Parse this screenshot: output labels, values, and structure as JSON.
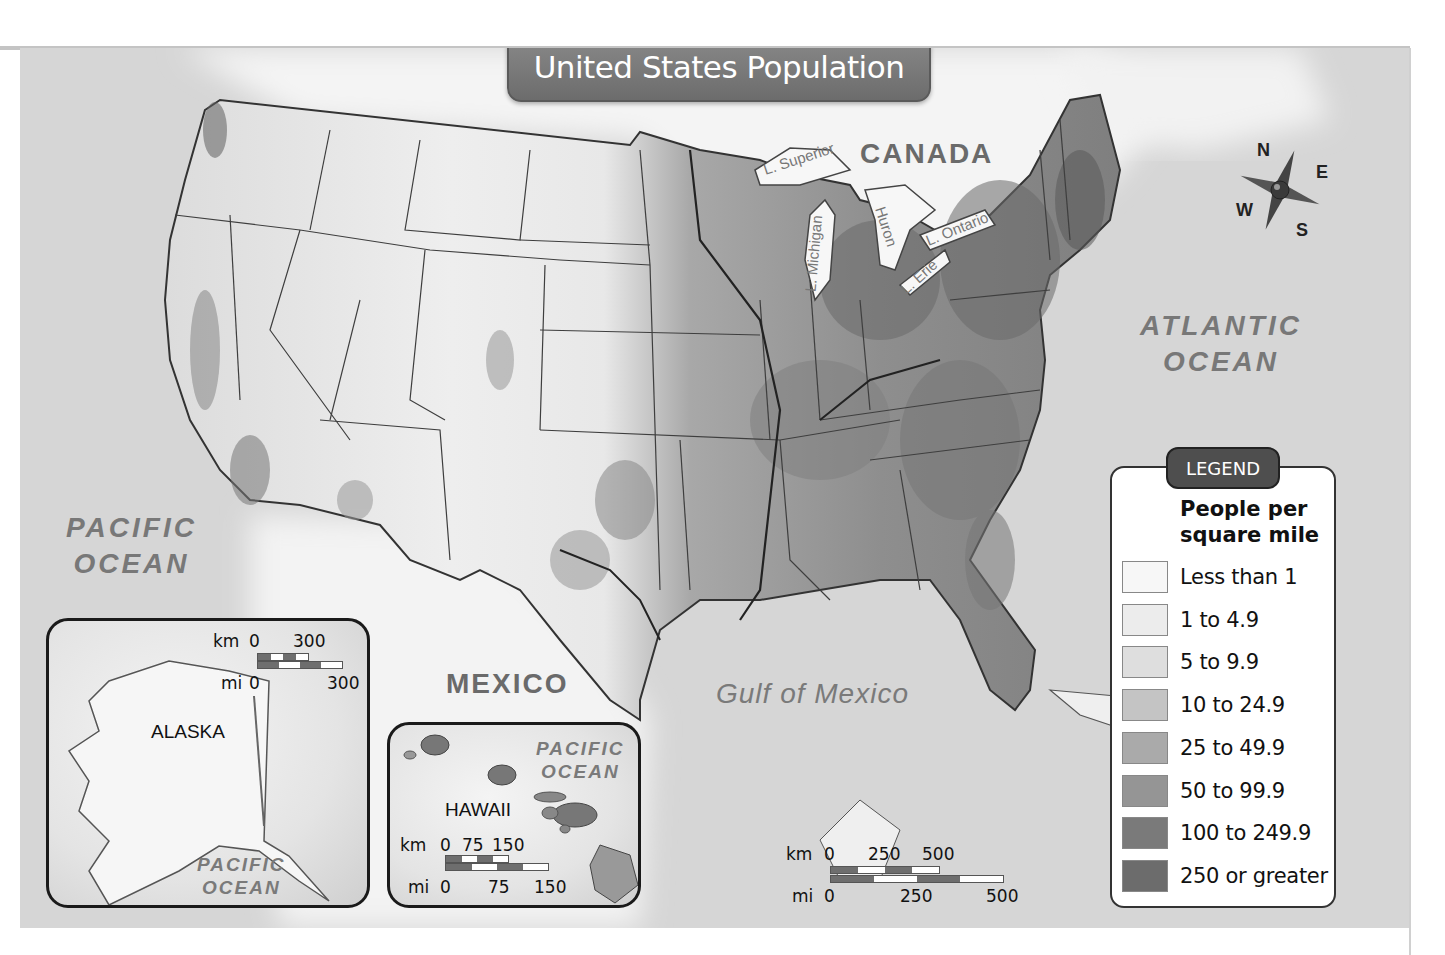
{
  "title": "United States Population",
  "labels": {
    "canada": "CANADA",
    "mexico": "MEXICO",
    "gulf": "Gulf of Mexico",
    "atlantic_line1": "ATLANTIC",
    "atlantic_line2": "OCEAN",
    "pacific_line1": "PACIFIC",
    "pacific_line2": "OCEAN"
  },
  "lakes": {
    "superior": "L. Superior",
    "michigan": "L. Michigan",
    "huron": "Huron",
    "ontario": "L. Ontario",
    "erie": "L. Erie"
  },
  "compass": {
    "n": "N",
    "e": "E",
    "s": "S",
    "w": "W"
  },
  "legend": {
    "tab": "LEGEND",
    "title_line1": "People per",
    "title_line2": "square mile",
    "items": [
      {
        "label": "Less than 1",
        "color": "#f7f7f7"
      },
      {
        "label": "1 to 4.9",
        "color": "#ececec"
      },
      {
        "label": "5 to 9.9",
        "color": "#dedede"
      },
      {
        "label": "10 to 24.9",
        "color": "#c4c4c4"
      },
      {
        "label": "25 to 49.9",
        "color": "#aaaaaa"
      },
      {
        "label": "50 to 99.9",
        "color": "#959595"
      },
      {
        "label": "100 to 249.9",
        "color": "#7a7a7a"
      },
      {
        "label": "250 or greater",
        "color": "#6c6c6c"
      }
    ]
  },
  "insets": {
    "alaska": {
      "label": "ALASKA",
      "ocean_line1": "PACIFIC",
      "ocean_line2": "OCEAN",
      "scale": {
        "km_unit": "km",
        "km_0": "0",
        "km_max": "300",
        "mi_unit": "mi",
        "mi_0": "0",
        "mi_max": "300"
      }
    },
    "hawaii": {
      "label": "HAWAII",
      "ocean_line1": "PACIFIC",
      "ocean_line2": "OCEAN",
      "scale": {
        "km_unit": "km",
        "km_0": "0",
        "km_mid": "75",
        "km_max": "150",
        "mi_unit": "mi",
        "mi_0": "0",
        "mi_mid": "75",
        "mi_max": "150"
      }
    }
  },
  "main_scale": {
    "km_unit": "km",
    "km_0": "0",
    "km_mid": "250",
    "km_max": "500",
    "mi_unit": "mi",
    "mi_0": "0",
    "mi_mid": "250",
    "mi_max": "500"
  },
  "colors": {
    "ocean": "#d6d6d6",
    "land_light": "#f2f2f2",
    "land_dense": "#7a7a7a",
    "banner": "#777777"
  }
}
